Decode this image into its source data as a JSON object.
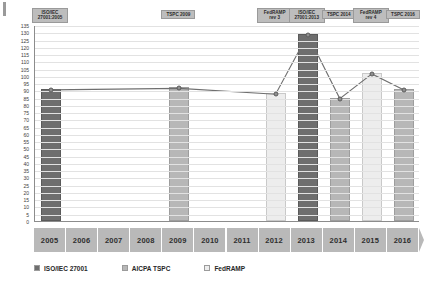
{
  "chart_data": {
    "type": "bar",
    "title": "",
    "subtitle": "",
    "xlabel": "",
    "ylabel": "",
    "ylim": [
      0,
      135
    ],
    "ytick_step": 5,
    "grid": true,
    "legend_position": "bottom",
    "categories": [
      "2005",
      "2006",
      "2007",
      "2008",
      "2009",
      "2010",
      "2011",
      "2012",
      "2013",
      "2014",
      "2015",
      "2016"
    ],
    "yticks": [
      "135",
      "130",
      "125",
      "120",
      "115",
      "110",
      "105",
      "100",
      "95",
      "90",
      "85",
      "80",
      "75",
      "70",
      "65",
      "60",
      "55",
      "50",
      "45",
      "40",
      "35",
      "30",
      "25",
      "20",
      "15",
      "10",
      "5",
      "0"
    ],
    "legend": [
      {
        "label": "ISO/IEC 27001",
        "color": "#6e6e6e",
        "key": "iso"
      },
      {
        "label": "AICPA TSPC",
        "color": "#b7b7b7",
        "key": "tspc"
      },
      {
        "label": "FedRAMP",
        "color": "#ededed",
        "key": "fedramp"
      }
    ],
    "bars": [
      {
        "category": "2005",
        "value": 91,
        "series": "ISO/IEC 27001",
        "key": "iso"
      },
      {
        "category": "2009",
        "value": 92,
        "series": "AICPA TSPC",
        "key": "tspc"
      },
      {
        "category": "2012",
        "value": 88,
        "series": "FedRAMP",
        "key": "fedramp"
      },
      {
        "category": "2013",
        "value": 129,
        "series": "ISO/IEC 27001",
        "key": "iso"
      },
      {
        "category": "2014",
        "value": 85,
        "series": "AICPA TSPC",
        "key": "tspc"
      },
      {
        "category": "2015",
        "value": 102,
        "series": "FedRAMP",
        "key": "fedramp"
      },
      {
        "category": "2016",
        "value": 91,
        "series": "AICPA TSPC",
        "key": "tspc"
      }
    ],
    "line_series": {
      "name": "control count trend",
      "points": [
        {
          "category": "2005",
          "value": 91
        },
        {
          "category": "2009",
          "value": 92
        },
        {
          "category": "2012",
          "value": 88
        },
        {
          "category": "2013",
          "value": 129
        },
        {
          "category": "2014",
          "value": 85
        },
        {
          "category": "2015",
          "value": 102
        },
        {
          "category": "2016",
          "value": 91
        }
      ]
    },
    "annotations": [
      {
        "category": "2005",
        "text": "ISO/IEC\n27001:2005"
      },
      {
        "category": "2009",
        "text": "TSPC 2009"
      },
      {
        "category": "2012",
        "text": "FedRAMP\nrev 3"
      },
      {
        "category": "2013",
        "text": "ISO/IEC\n27001:2013"
      },
      {
        "category": "2014",
        "text": "TSPC 2014"
      },
      {
        "category": "2015",
        "text": "FedRAMP\nrev 4"
      },
      {
        "category": "2016",
        "text": "TSPC 2016"
      }
    ]
  }
}
